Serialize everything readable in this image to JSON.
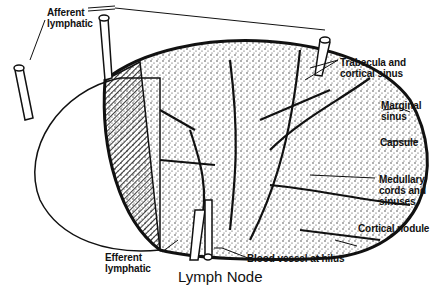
{
  "diagram": {
    "title": "Lymph Node",
    "labels": {
      "afferent_lymphatic": "Afferent\nlymphatic",
      "trabecula_cortical_sinus": "Trabecula and\ncortical sinus",
      "marginal_sinus": "Marginal\nsinus",
      "capsule": "Capsule",
      "medullary_cords": "Medullary\ncords and\nsinuses",
      "cortical_nodule": "Cortical nodule",
      "efferent_lymphatic": "Efferent\nlymphatic",
      "blood_vessel_hilus": "Blood vessel at hilus"
    },
    "colors": {
      "ink": "#111111",
      "background": "#ffffff"
    }
  }
}
